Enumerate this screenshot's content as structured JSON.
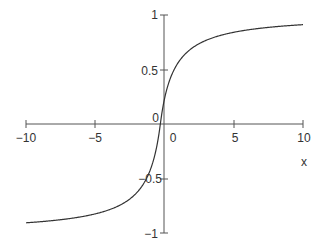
{
  "chart_data": {
    "type": "line",
    "title": "",
    "xlabel": "x",
    "ylabel": "",
    "xlim": [
      -10,
      10
    ],
    "ylim": [
      -1,
      1
    ],
    "grid": false,
    "legend": null,
    "x_ticks": [
      "-10",
      "-5",
      "0",
      "5",
      "10"
    ],
    "y_ticks": [
      "-1",
      "-0.5",
      "0",
      "0.5",
      "1"
    ],
    "function": "x/(1+|x|)",
    "series": [
      {
        "name": "curve",
        "x": [
          -10,
          -8,
          -6,
          -5,
          -4,
          -3,
          -2,
          -1,
          -0.5,
          0,
          0.5,
          1,
          2,
          3,
          4,
          5,
          6,
          8,
          10
        ],
        "values": [
          -0.909,
          -0.889,
          -0.857,
          -0.833,
          -0.8,
          -0.75,
          -0.667,
          -0.5,
          -0.333,
          0,
          0.333,
          0.5,
          0.667,
          0.75,
          0.8,
          0.833,
          0.857,
          0.889,
          0.909
        ]
      }
    ]
  },
  "labels": {
    "x_tick_m10": "−10",
    "x_tick_m5": "−5",
    "x_tick_0": "0",
    "x_tick_5": "5",
    "x_tick_10": "10",
    "y_tick_1": "1",
    "y_tick_05": "0.5",
    "y_tick_0": "0",
    "y_tick_m05": "−0.5",
    "y_tick_m1": "−1",
    "xlabel": "x"
  },
  "colors": {
    "axis": "#444444",
    "curve": "#333333"
  }
}
